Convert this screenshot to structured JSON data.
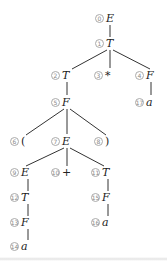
{
  "diagram": {
    "type": "parse-tree",
    "edge_color": "#333333",
    "nodes": [
      {
        "id": "0",
        "label": "E",
        "x": 100,
        "y": 18
      },
      {
        "id": "1",
        "label": "T",
        "x": 100,
        "y": 43
      },
      {
        "id": "2",
        "label": "T",
        "x": 56,
        "y": 75
      },
      {
        "id": "3",
        "label": "*",
        "x": 99,
        "y": 75
      },
      {
        "id": "4",
        "label": "F",
        "x": 140,
        "y": 75
      },
      {
        "id": "5",
        "label": "F",
        "x": 56,
        "y": 102
      },
      {
        "id": "17",
        "label": "a",
        "x": 140,
        "y": 102
      },
      {
        "id": "6",
        "label": "(",
        "x": 15,
        "y": 141
      },
      {
        "id": "7",
        "label": "E",
        "x": 56,
        "y": 141
      },
      {
        "id": "8",
        "label": ")",
        "x": 99,
        "y": 141
      },
      {
        "id": "9",
        "label": "E",
        "x": 15,
        "y": 172
      },
      {
        "id": "10",
        "label": "+",
        "x": 56,
        "y": 172
      },
      {
        "id": "11",
        "label": "T",
        "x": 96,
        "y": 172
      },
      {
        "id": "12",
        "label": "T",
        "x": 15,
        "y": 197
      },
      {
        "id": "15",
        "label": "F",
        "x": 96,
        "y": 197
      },
      {
        "id": "13",
        "label": "F",
        "x": 15,
        "y": 222
      },
      {
        "id": "16",
        "label": "a",
        "x": 96,
        "y": 222
      },
      {
        "id": "14",
        "label": "a",
        "x": 15,
        "y": 246
      }
    ],
    "edges": [
      [
        110,
        25,
        110,
        37
      ],
      [
        107,
        50,
        72,
        69
      ],
      [
        110,
        50,
        110,
        68
      ],
      [
        113,
        50,
        150,
        69
      ],
      [
        67,
        82,
        67,
        95
      ],
      [
        151,
        82,
        151,
        95
      ],
      [
        64,
        109,
        26,
        135
      ],
      [
        67,
        109,
        67,
        134
      ],
      [
        70,
        109,
        106,
        135
      ],
      [
        64,
        148,
        26,
        166
      ],
      [
        67,
        148,
        67,
        166
      ],
      [
        70,
        148,
        104,
        166
      ],
      [
        28,
        179,
        28,
        191
      ],
      [
        28,
        204,
        28,
        216
      ],
      [
        28,
        229,
        28,
        240
      ],
      [
        108,
        179,
        108,
        191
      ],
      [
        108,
        204,
        108,
        216
      ]
    ]
  }
}
